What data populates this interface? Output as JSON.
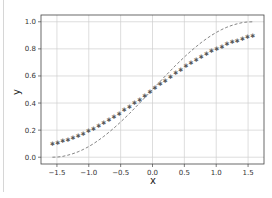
{
  "chart_data": {
    "type": "line",
    "title": "",
    "xlabel": "x",
    "ylabel": "y",
    "xlim": [
      -1.75,
      1.75
    ],
    "ylim": [
      -0.05,
      1.05
    ],
    "grid": true,
    "legend": null,
    "x_ticks": [
      -1.5,
      -1.0,
      -0.5,
      0.0,
      0.5,
      1.0,
      1.5
    ],
    "x_tick_labels": [
      "−1.5",
      "−1.0",
      "−0.5",
      "0.0",
      "0.5",
      "1.0",
      "1.5"
    ],
    "y_ticks": [
      0.0,
      0.2,
      0.4,
      0.6,
      0.8,
      1.0
    ],
    "y_tick_labels": [
      "0.0",
      "0.2",
      "0.4",
      "0.6",
      "0.8",
      "1.0"
    ],
    "x": [
      -1.571,
      -1.49,
      -1.41,
      -1.329,
      -1.249,
      -1.168,
      -1.088,
      -1.007,
      -0.926,
      -0.846,
      -0.765,
      -0.685,
      -0.604,
      -0.524,
      -0.443,
      -0.363,
      -0.282,
      -0.201,
      -0.121,
      -0.04,
      0.04,
      0.121,
      0.201,
      0.282,
      0.363,
      0.443,
      0.524,
      0.604,
      0.685,
      0.765,
      0.846,
      0.926,
      1.007,
      1.088,
      1.168,
      1.249,
      1.329,
      1.41,
      1.49,
      1.571
    ],
    "series": [
      {
        "name": "star-markers",
        "style": "markers",
        "marker": "*",
        "color": "#555555",
        "values": [
          0.1,
          0.11,
          0.122,
          0.135,
          0.148,
          0.163,
          0.179,
          0.196,
          0.215,
          0.234,
          0.255,
          0.277,
          0.3,
          0.324,
          0.35,
          0.376,
          0.402,
          0.43,
          0.458,
          0.486,
          0.514,
          0.542,
          0.57,
          0.598,
          0.624,
          0.65,
          0.676,
          0.7,
          0.723,
          0.745,
          0.766,
          0.785,
          0.804,
          0.821,
          0.837,
          0.852,
          0.865,
          0.878,
          0.89,
          0.9
        ]
      },
      {
        "name": "dashed-curve",
        "style": "dashed",
        "color": "#777777",
        "values": [
          0.0,
          0.002,
          0.006,
          0.015,
          0.026,
          0.04,
          0.057,
          0.077,
          0.1,
          0.126,
          0.154,
          0.184,
          0.216,
          0.25,
          0.286,
          0.322,
          0.361,
          0.4,
          0.44,
          0.48,
          0.52,
          0.56,
          0.6,
          0.639,
          0.678,
          0.714,
          0.75,
          0.784,
          0.816,
          0.846,
          0.874,
          0.9,
          0.923,
          0.943,
          0.96,
          0.974,
          0.985,
          0.994,
          0.998,
          1.0
        ]
      }
    ]
  },
  "colors": {
    "frame": "#444444",
    "grid": "#cfcfcf",
    "left_rule": "#d6d6d6"
  }
}
